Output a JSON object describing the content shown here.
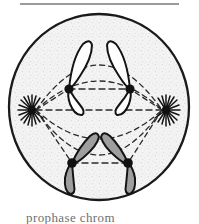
{
  "figure": {
    "name": "cell-division-metaphase-diagram",
    "caption": "prophase  chrom",
    "top_rule_color": "#9a9a9a",
    "background_color": "#ffffff"
  },
  "cell": {
    "label": "cell-membrane",
    "center_x": 99,
    "center_y": 107,
    "radius_x": 91,
    "radius_y": 94,
    "outline_color": "#1a1a1a",
    "outline_width": 2.2,
    "cytoplasm_color": "#f2f2f2",
    "cytoplasm_texture": "stippled"
  },
  "spindle": {
    "label": "mitotic-spindle",
    "fiber_color": "#2b2b2b",
    "fiber_style": "dashed",
    "dash_pattern": "5,4",
    "equator_label": "metaphase-plate"
  },
  "centrosomes": [
    {
      "id": "centrosome-left",
      "label": "aster-left",
      "x": 32,
      "y": 110,
      "dot_radius": 4.0,
      "ray_count": 16,
      "ray_length": 13,
      "color": "#111111"
    },
    {
      "id": "centrosome-right",
      "label": "aster-right",
      "x": 166,
      "y": 110,
      "dot_radius": 4.0,
      "ray_count": 16,
      "ray_length": 13,
      "color": "#111111"
    }
  ],
  "chromosomes": [
    {
      "id": "chromosome-upper-left",
      "label": "chromosome-upper-left",
      "fill": "#ffffff",
      "stroke": "#141414",
      "centromere_x": 69,
      "centromere_y": 89,
      "arm_long_angle": -68,
      "arm_long_length": 46,
      "arm_short_angle": 96,
      "arm_short_length": 23
    },
    {
      "id": "chromosome-upper-right",
      "label": "chromosome-upper-right",
      "fill": "#ffffff",
      "stroke": "#141414",
      "centromere_x": 130,
      "centromere_y": 89,
      "arm_long_angle": -112,
      "arm_long_length": 46,
      "arm_short_angle": 84,
      "arm_short_length": 23
    },
    {
      "id": "chromosome-lower-left",
      "label": "chromosome-lower-left",
      "fill": "#9e9e9e",
      "stroke": "#141414",
      "centromere_x": 72,
      "centromere_y": 163,
      "arm_long_angle": -56,
      "arm_long_length": 38,
      "arm_short_angle": 100,
      "arm_short_length": 27
    },
    {
      "id": "chromosome-lower-right",
      "label": "chromosome-lower-right",
      "fill": "#9e9e9e",
      "stroke": "#141414",
      "centromere_x": 128,
      "centromere_y": 163,
      "arm_long_angle": -124,
      "arm_long_length": 38,
      "arm_short_angle": 80,
      "arm_short_length": 27
    }
  ],
  "centromere": {
    "label": "centromere",
    "color": "#111111",
    "radius": 4.6
  }
}
